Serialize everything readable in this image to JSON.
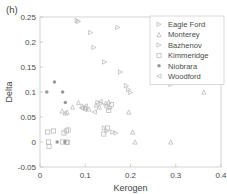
{
  "panel": {
    "label": "(h)"
  },
  "chart_data": {
    "type": "scatter",
    "title": "",
    "xlabel": "Kerogen",
    "ylabel": "Delta",
    "xlim": [
      0,
      0.4
    ],
    "ylim": [
      -0.05,
      0.25
    ],
    "xticks": [
      0,
      0.1,
      0.2,
      0.3,
      0.4
    ],
    "xtick_labels": [
      "0",
      "0.1",
      "0.2",
      "0.3",
      "0.4"
    ],
    "yticks": [
      -0.05,
      0,
      0.05,
      0.1,
      0.15,
      0.2,
      0.25
    ],
    "ytick_labels": [
      "-0.05",
      "0",
      "0.05",
      "0.1",
      "0.15",
      "0.2",
      "0.25"
    ],
    "grid": false,
    "legend_position": "upper right",
    "series": [
      {
        "name": "Eagle Ford",
        "marker": "right-triangle",
        "color": "#b3b3b3",
        "points": [
          [
            0.082,
            0.243
          ],
          [
            0.085,
            0.241
          ],
          [
            0.112,
            0.219
          ],
          [
            0.119,
            0.189
          ],
          [
            0.143,
            0.16
          ],
          [
            0.172,
            0.229
          ],
          [
            0.178,
            0.14
          ],
          [
            0.191,
            0.113
          ],
          [
            0.196,
            0.105
          ],
          [
            0.2,
            0.099
          ]
        ]
      },
      {
        "name": "Monterey",
        "marker": "up-triangle",
        "color": "#b3b3b3",
        "points": [
          [
            0.049,
            0.062
          ],
          [
            0.056,
            0.058
          ],
          [
            0.06,
            0.06
          ],
          [
            0.072,
            0.07
          ],
          [
            0.085,
            0.079
          ],
          [
            0.093,
            0.072
          ],
          [
            0.101,
            0.069
          ],
          [
            0.108,
            0.066
          ],
          [
            0.124,
            0.074
          ],
          [
            0.131,
            0.07
          ],
          [
            0.145,
            0.078
          ],
          [
            0.152,
            0.08
          ],
          [
            0.196,
            0.06
          ],
          [
            0.205,
            0.02
          ],
          [
            0.21,
            0.0
          ],
          [
            0.289,
            0.0
          ],
          [
            0.362,
            0.1
          ]
        ]
      },
      {
        "name": "Bazhenov",
        "marker": "right-triangle",
        "color": "#b3b3b3",
        "points": [
          [
            0.128,
            0.079
          ],
          [
            0.135,
            0.077
          ],
          [
            0.148,
            0.072
          ],
          [
            0.155,
            0.068
          ],
          [
            0.142,
            0.028
          ],
          [
            0.148,
            0.022
          ],
          [
            0.161,
            0.02
          ],
          [
            0.168,
            0.018
          ],
          [
            0.289,
            0.115
          ]
        ]
      },
      {
        "name": "Kimmeridge",
        "marker": "square",
        "color": "#b3b3b3",
        "points": [
          [
            0.017,
            0.02
          ],
          [
            0.019,
            0.0
          ],
          [
            0.02,
            -0.009
          ],
          [
            0.03,
            0.022
          ],
          [
            0.053,
            0.018
          ],
          [
            0.058,
            0.022
          ],
          [
            0.062,
            0.024
          ],
          [
            0.05,
            0.0
          ],
          [
            0.058,
            0.0
          ],
          [
            0.061,
            -0.001
          ],
          [
            0.141,
            0.016
          ],
          [
            0.149,
            0.028
          ],
          [
            0.152,
            0.063
          ],
          [
            0.158,
            0.075
          ]
        ]
      },
      {
        "name": "Niobrara",
        "marker": "dot",
        "color": "#999999",
        "points": [
          [
            0.015,
            0.1
          ],
          [
            0.032,
            0.12
          ],
          [
            0.05,
            0.1
          ],
          [
            0.056,
            0.079
          ],
          [
            0.038,
            0.0
          ],
          [
            0.055,
            0.0
          ]
        ]
      },
      {
        "name": "Woodford",
        "marker": "left-triangle",
        "color": "#b3b3b3",
        "points": [
          [
            0.092,
            0.068
          ],
          [
            0.098,
            0.065
          ],
          [
            0.1,
            0.072
          ],
          [
            0.133,
            0.081
          ],
          [
            0.12,
            0.06
          ]
        ]
      }
    ]
  }
}
